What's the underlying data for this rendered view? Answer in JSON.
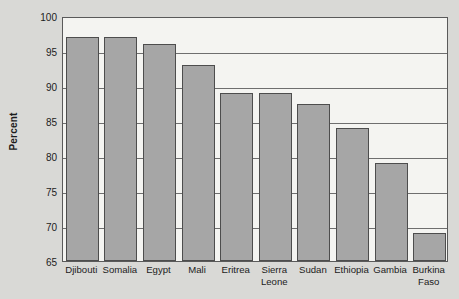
{
  "chart_data": {
    "type": "bar",
    "title": "",
    "subtitle": "",
    "xlabel": "",
    "ylabel": "Percent",
    "categories": [
      "Djibouti",
      "Somalia",
      "Egypt",
      "Mali",
      "Eritrea",
      "Sierra Leone",
      "Sudan",
      "Ethiopia",
      "Gambia",
      "Burkina Faso"
    ],
    "values": [
      97,
      97,
      96,
      93,
      89,
      89,
      87.5,
      84,
      79,
      69
    ],
    "ylim": [
      65,
      100
    ],
    "yticks": [
      65,
      70,
      75,
      80,
      85,
      90,
      95,
      100
    ],
    "ytick_labels": [
      "65",
      "70",
      "75",
      "80",
      "85",
      "90",
      "95",
      "100"
    ],
    "grid": true,
    "legend": false,
    "legend_position": "none",
    "series": [
      {
        "name": "Percent",
        "values": [
          97,
          97,
          96,
          93,
          89,
          89,
          87.5,
          84,
          79,
          69
        ]
      }
    ],
    "colors": {
      "bar_fill": "#a6a6a6",
      "bar_border": "#4d4d4d",
      "plot_background": "#f4f4f1",
      "figure_background": "#d9d9d6",
      "gridline": "#6e6e6e",
      "text": "#1c1c1c"
    }
  }
}
